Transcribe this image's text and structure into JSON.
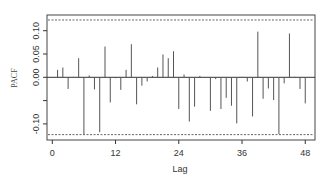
{
  "chart_data": {
    "type": "bar",
    "subtype": "pacf-spikes",
    "title": "",
    "xlabel": "Lag",
    "ylabel": "PACF",
    "xlim": [
      0,
      49
    ],
    "ylim": [
      -0.135,
      0.135
    ],
    "x_ticks": [
      0,
      12,
      24,
      36,
      48
    ],
    "y_ticks": [
      -0.1,
      -0.05,
      0.0,
      0.05,
      0.1
    ],
    "y_tick_labels": [
      "-0.10",
      "",
      "0.00",
      "0.05",
      "0.10"
    ],
    "confidence_bound": 0.123,
    "grid": false,
    "legend": null,
    "lags": [
      1,
      2,
      3,
      4,
      5,
      6,
      7,
      8,
      9,
      10,
      11,
      12,
      13,
      14,
      15,
      16,
      17,
      18,
      19,
      20,
      21,
      22,
      23,
      24,
      25,
      26,
      27,
      28,
      29,
      30,
      31,
      32,
      33,
      34,
      35,
      36,
      37,
      38,
      39,
      40,
      41,
      42,
      43,
      44,
      45,
      46,
      47,
      48
    ],
    "values": [
      0.016,
      0.021,
      -0.025,
      0.001,
      0.041,
      -0.122,
      0.004,
      -0.026,
      -0.118,
      0.066,
      -0.054,
      -0.002,
      -0.027,
      0.016,
      0.071,
      -0.058,
      -0.018,
      -0.009,
      0.003,
      0.021,
      0.049,
      0.041,
      0.056,
      -0.068,
      0.006,
      -0.095,
      -0.063,
      0.003,
      -0.001,
      -0.072,
      -0.004,
      -0.068,
      -0.044,
      -0.061,
      -0.099,
      0.001,
      -0.009,
      -0.084,
      0.098,
      -0.046,
      -0.024,
      -0.049,
      -0.122,
      -0.013,
      0.094,
      0.001,
      -0.025,
      -0.056
    ]
  },
  "colors": {
    "bars": "#555555",
    "axis": "#333333",
    "dashed_bounds": "#666666"
  }
}
